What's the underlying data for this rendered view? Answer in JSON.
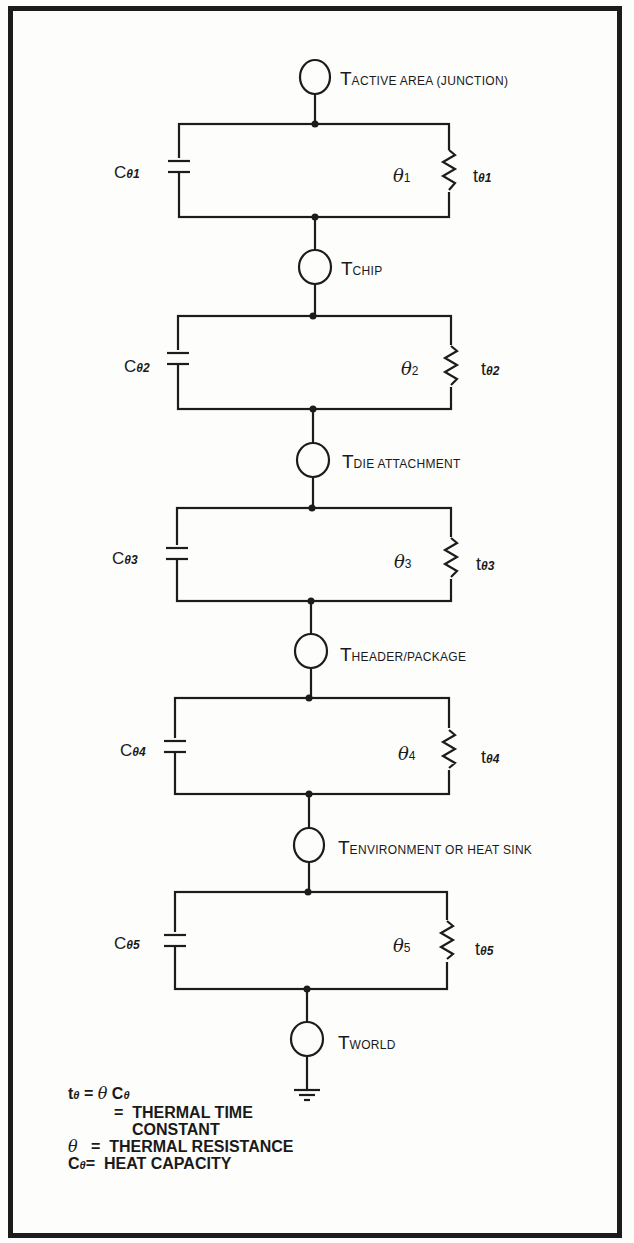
{
  "diagram": {
    "type": "thermal equivalent circuit",
    "nodes": [
      {
        "id": "T1",
        "symbol": "T",
        "subscript": "ACTIVE AREA (JUNCTION)"
      },
      {
        "id": "T2",
        "symbol": "T",
        "subscript": "CHIP"
      },
      {
        "id": "T3",
        "symbol": "T",
        "subscript": "DIE ATTACHMENT"
      },
      {
        "id": "T4",
        "symbol": "T",
        "subscript": "HEADER/PACKAGE"
      },
      {
        "id": "T5",
        "symbol": "T",
        "subscript": "ENVIRONMENT OR HEAT SINK"
      },
      {
        "id": "T6",
        "symbol": "T",
        "subscript": "WORLD"
      }
    ],
    "stages": [
      {
        "capacitor": {
          "symbol": "C",
          "subscript": "θ1"
        },
        "resistor": {
          "symbol": "θ",
          "subscript": "1"
        },
        "time_constant": {
          "symbol": "t",
          "subscript": "θ1"
        }
      },
      {
        "capacitor": {
          "symbol": "C",
          "subscript": "θ2"
        },
        "resistor": {
          "symbol": "θ",
          "subscript": "2"
        },
        "time_constant": {
          "symbol": "t",
          "subscript": "θ2"
        }
      },
      {
        "capacitor": {
          "symbol": "C",
          "subscript": "θ3"
        },
        "resistor": {
          "symbol": "θ",
          "subscript": "3"
        },
        "time_constant": {
          "symbol": "t",
          "subscript": "θ3"
        }
      },
      {
        "capacitor": {
          "symbol": "C",
          "subscript": "θ4"
        },
        "resistor": {
          "symbol": "θ",
          "subscript": "4"
        },
        "time_constant": {
          "symbol": "t",
          "subscript": "θ4"
        }
      },
      {
        "capacitor": {
          "symbol": "C",
          "subscript": "θ5"
        },
        "resistor": {
          "symbol": "θ",
          "subscript": "5"
        },
        "time_constant": {
          "symbol": "t",
          "subscript": "θ5"
        }
      }
    ],
    "ground_symbol": "ground"
  },
  "legend": {
    "line1": {
      "sym": "t",
      "sym_sub": "θ",
      "eq": "=",
      "def_sym": "θ",
      "def_sym2": "C",
      "def_sub": "θ"
    },
    "line2": {
      "eq": "=",
      "text": "THERMAL TIME"
    },
    "line3": {
      "text": "CONSTANT"
    },
    "line4": {
      "sym": "θ",
      "eq": "=",
      "text": "THERMAL RESISTANCE"
    },
    "line5": {
      "sym": "C",
      "sym_sub": "θ",
      "eq": "=",
      "text": "HEAT CAPACITY"
    }
  }
}
